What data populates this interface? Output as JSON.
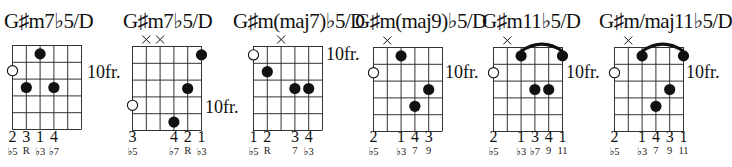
{
  "chords": [
    {
      "name": "G♯m7♭5/D",
      "position_label": "10fr.",
      "muted_strings": [],
      "open_marker": {
        "string": 1,
        "fret": 2
      },
      "dots": [
        {
          "string": 3,
          "fret": 1
        },
        {
          "string": 2,
          "fret": 3
        },
        {
          "string": 4,
          "fret": 3
        }
      ],
      "barre": null,
      "fingers": [
        {
          "string": 1,
          "label": "2"
        },
        {
          "string": 2,
          "label": "3"
        },
        {
          "string": 3,
          "label": "1"
        },
        {
          "string": 4,
          "label": "4"
        }
      ],
      "intervals": [
        {
          "string": 1,
          "label": "♭5"
        },
        {
          "string": 2,
          "label": "R"
        },
        {
          "string": 3,
          "label": "♭3"
        },
        {
          "string": 4,
          "label": "♭7"
        }
      ]
    },
    {
      "name": "G♯m7♭5/D",
      "position_label": "10fr.",
      "muted_strings": [
        2,
        3
      ],
      "open_marker": {
        "string": 1,
        "fret": 4
      },
      "dots": [
        {
          "string": 6,
          "fret": 1
        },
        {
          "string": 5,
          "fret": 3
        },
        {
          "string": 4,
          "fret": 5
        }
      ],
      "barre": null,
      "fingers": [
        {
          "string": 1,
          "label": "3"
        },
        {
          "string": 4,
          "label": "4"
        },
        {
          "string": 5,
          "label": "2"
        },
        {
          "string": 6,
          "label": "1"
        }
      ],
      "intervals": [
        {
          "string": 1,
          "label": "♭5"
        },
        {
          "string": 4,
          "label": "♭7"
        },
        {
          "string": 5,
          "label": "R"
        },
        {
          "string": 6,
          "label": "♭3"
        }
      ]
    },
    {
      "name": "G♯m(maj7)♭5/D",
      "position_label": "10fr.",
      "muted_strings": [
        3
      ],
      "open_marker": {
        "string": 1,
        "fret": 1
      },
      "dots": [
        {
          "string": 2,
          "fret": 2
        },
        {
          "string": 4,
          "fret": 3
        },
        {
          "string": 5,
          "fret": 3
        }
      ],
      "barre": null,
      "fingers": [
        {
          "string": 1,
          "label": "1"
        },
        {
          "string": 2,
          "label": "2"
        },
        {
          "string": 4,
          "label": "3"
        },
        {
          "string": 5,
          "label": "4"
        }
      ],
      "intervals": [
        {
          "string": 1,
          "label": "♭5"
        },
        {
          "string": 2,
          "label": "R"
        },
        {
          "string": 4,
          "label": "7"
        },
        {
          "string": 5,
          "label": "♭3"
        }
      ]
    },
    {
      "name": "G♯m(maj9)♭5/D",
      "position_label": "10fr.",
      "muted_strings": [
        2
      ],
      "open_marker": {
        "string": 1,
        "fret": 2
      },
      "dots": [
        {
          "string": 3,
          "fret": 1
        },
        {
          "string": 5,
          "fret": 3
        },
        {
          "string": 4,
          "fret": 4
        }
      ],
      "barre": null,
      "fingers": [
        {
          "string": 1,
          "label": "2"
        },
        {
          "string": 3,
          "label": "1"
        },
        {
          "string": 4,
          "label": "4"
        },
        {
          "string": 5,
          "label": "3"
        }
      ],
      "intervals": [
        {
          "string": 1,
          "label": "♭5"
        },
        {
          "string": 3,
          "label": "♭3"
        },
        {
          "string": 4,
          "label": "7"
        },
        {
          "string": 5,
          "label": "9"
        }
      ]
    },
    {
      "name": "G♯m11♭5/D",
      "position_label": "10fr.",
      "muted_strings": [
        2
      ],
      "open_marker": {
        "string": 1,
        "fret": 2
      },
      "dots": [
        {
          "string": 3,
          "fret": 1
        },
        {
          "string": 6,
          "fret": 1
        },
        {
          "string": 4,
          "fret": 3
        },
        {
          "string": 5,
          "fret": 3
        }
      ],
      "barre": {
        "from": 3,
        "to": 6,
        "fret": 1
      },
      "fingers": [
        {
          "string": 1,
          "label": "2"
        },
        {
          "string": 3,
          "label": "1"
        },
        {
          "string": 4,
          "label": "3"
        },
        {
          "string": 5,
          "label": "4"
        },
        {
          "string": 6,
          "label": "1"
        }
      ],
      "intervals": [
        {
          "string": 1,
          "label": "♭5"
        },
        {
          "string": 3,
          "label": "♭3"
        },
        {
          "string": 4,
          "label": "♭7"
        },
        {
          "string": 5,
          "label": "9"
        },
        {
          "string": 6,
          "label": "11"
        }
      ]
    },
    {
      "name": "G♯m/maj11♭5/D",
      "position_label": "10fr.",
      "muted_strings": [
        2
      ],
      "open_marker": {
        "string": 1,
        "fret": 2
      },
      "dots": [
        {
          "string": 3,
          "fret": 1
        },
        {
          "string": 6,
          "fret": 1
        },
        {
          "string": 5,
          "fret": 3
        },
        {
          "string": 4,
          "fret": 4
        }
      ],
      "barre": {
        "from": 3,
        "to": 6,
        "fret": 1
      },
      "fingers": [
        {
          "string": 1,
          "label": "2"
        },
        {
          "string": 3,
          "label": "1"
        },
        {
          "string": 4,
          "label": "4"
        },
        {
          "string": 5,
          "label": "3"
        },
        {
          "string": 6,
          "label": "1"
        }
      ],
      "intervals": [
        {
          "string": 1,
          "label": "♭5"
        },
        {
          "string": 3,
          "label": "♭3"
        },
        {
          "string": 4,
          "label": "7"
        },
        {
          "string": 5,
          "label": "9"
        },
        {
          "string": 6,
          "label": "11"
        }
      ]
    }
  ],
  "colors": {
    "ink": "#111111",
    "grid": "#333333",
    "background": "#ffffff"
  }
}
